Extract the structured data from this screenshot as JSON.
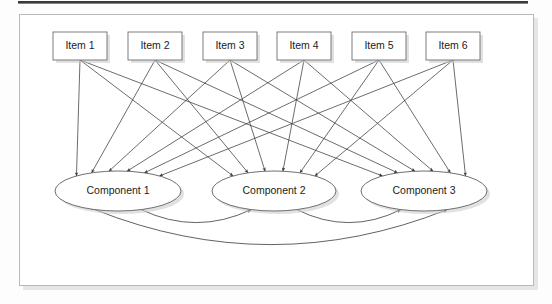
{
  "figure": {
    "type": "directed-graph-diagram",
    "title_bar": {
      "name": "top-rule",
      "color": "#3a3a3a"
    },
    "panel": {
      "background": "#ffffff",
      "border_color": "#b9b9b9"
    },
    "items": [
      {
        "id": "item-1",
        "label": "Item 1",
        "cx": 80,
        "cy": 46
      },
      {
        "id": "item-2",
        "label": "Item 2",
        "cx": 155,
        "cy": 46
      },
      {
        "id": "item-3",
        "label": "Item 3",
        "cx": 230,
        "cy": 46
      },
      {
        "id": "item-4",
        "label": "Item 4",
        "cx": 304,
        "cy": 46
      },
      {
        "id": "item-5",
        "label": "Item 5",
        "cx": 379,
        "cy": 46
      },
      {
        "id": "item-6",
        "label": "Item 6",
        "cx": 453,
        "cy": 46
      }
    ],
    "item_box": {
      "width": 54,
      "height": 28
    },
    "components": [
      {
        "id": "component-1",
        "label": "Component 1",
        "cx": 118,
        "cy": 191,
        "rx": 63,
        "ry": 20
      },
      {
        "id": "component-2",
        "label": "Component 2",
        "cx": 274,
        "cy": 191,
        "rx": 62,
        "ry": 20
      },
      {
        "id": "component-3",
        "label": "Component 3",
        "cx": 424,
        "cy": 191,
        "rx": 63,
        "ry": 20
      }
    ],
    "edges": {
      "item_to_component": "every item connects to every component",
      "item_to_component_count": 18,
      "component_to_component": [
        {
          "from": "component-1",
          "to": "component-2",
          "style": "curved",
          "bidirectional": true
        },
        {
          "from": "component-2",
          "to": "component-3",
          "style": "curved",
          "bidirectional": true
        },
        {
          "from": "component-1",
          "to": "component-3",
          "style": "curved-wide",
          "bidirectional": true
        }
      ],
      "arrow_color": "#3b3b3b"
    },
    "colors": {
      "node_fill": "#ffffff",
      "node_stroke": "#6e6e6e",
      "text": "#1c1c1c",
      "edge": "#3b3b3b",
      "panel_border": "#b9b9b9",
      "rule": "#3a3a3a"
    }
  }
}
